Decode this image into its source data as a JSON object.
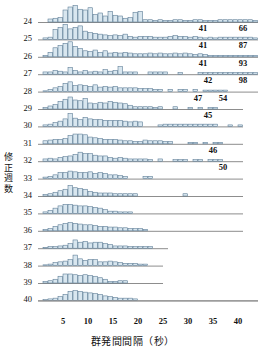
{
  "axes": {
    "y_title": "修正週数",
    "y_title_chars": [
      "修",
      "正",
      "週",
      "数"
    ],
    "x_title": "群発間間隔（秒）",
    "x_ticks": [
      5,
      10,
      15,
      20,
      25,
      30,
      35,
      40
    ],
    "x_min": 0,
    "x_max": 44,
    "row_labels": [
      24,
      25,
      26,
      27,
      28,
      29,
      30,
      31,
      32,
      33,
      34,
      35,
      36,
      37,
      38,
      39,
      40
    ]
  },
  "colors": {
    "bar_fill": "#d8e6ef",
    "bar_stroke": "#53748f",
    "baseline": "#8d8d8d",
    "text": "#111111"
  },
  "chart_data": {
    "type": "bar",
    "title": "",
    "xlabel": "群発間間隔（秒）",
    "ylabel": "修正週数",
    "xlim": [
      0,
      44
    ],
    "grid": false,
    "legend": null,
    "bin_width": 1,
    "note": "Ridgeline of 17 histograms, one per corrected gestational week (24-40). Values are relative frequencies per 1-second bin of inter-burst interval.",
    "series": [
      {
        "name": "24",
        "baseline_end": 44,
        "annotations": [
          {
            "text": "41",
            "x": 33
          },
          {
            "text": "66",
            "x": 41
          }
        ],
        "values": [
          0,
          0,
          4,
          5,
          6,
          16,
          20,
          22,
          17,
          16,
          19,
          10,
          12,
          8,
          14,
          9,
          8,
          5,
          6,
          13,
          14,
          3,
          3,
          2,
          3,
          2,
          2,
          3,
          3,
          2,
          2,
          3,
          3,
          2,
          2,
          2,
          3,
          3,
          3,
          3,
          3,
          3,
          3,
          2
        ]
      },
      {
        "name": "25",
        "baseline_end": 44,
        "annotations": [
          {
            "text": "41",
            "x": 33
          },
          {
            "text": "87",
            "x": 41
          }
        ],
        "values": [
          0,
          2,
          3,
          13,
          16,
          20,
          14,
          16,
          18,
          11,
          9,
          8,
          7,
          6,
          5,
          6,
          5,
          7,
          4,
          3,
          4,
          4,
          4,
          3,
          3,
          3,
          4,
          5,
          4,
          4,
          3,
          4,
          3,
          2,
          3,
          2,
          3,
          3,
          3,
          3,
          3,
          3,
          3,
          2
        ]
      },
      {
        "name": "26",
        "baseline_end": 44,
        "annotations": [
          {
            "text": "41",
            "x": 33
          },
          {
            "text": "93",
            "x": 41
          }
        ],
        "values": [
          0,
          2,
          6,
          12,
          15,
          18,
          20,
          14,
          11,
          8,
          7,
          9,
          6,
          8,
          5,
          6,
          5,
          6,
          5,
          4,
          4,
          4,
          5,
          4,
          5,
          4,
          4,
          5,
          4,
          5,
          4,
          3,
          4,
          3,
          2,
          2,
          2,
          2,
          2,
          2,
          2,
          2,
          2,
          2
        ]
      },
      {
        "name": "27",
        "baseline_end": 44,
        "annotations": [
          {
            "text": "42",
            "x": 34
          },
          {
            "text": "98",
            "x": 41
          }
        ],
        "values": [
          0,
          3,
          3,
          5,
          4,
          3,
          9,
          5,
          3,
          5,
          3,
          4,
          3,
          6,
          4,
          5,
          10,
          3,
          3,
          3,
          0,
          0,
          3,
          3,
          3,
          3,
          0,
          0,
          2,
          0,
          0,
          0,
          2,
          2,
          2,
          2,
          2,
          2,
          2,
          2,
          2,
          2,
          2,
          2
        ]
      },
      {
        "name": "28",
        "baseline_end": 44,
        "annotations": [
          {
            "text": "47",
            "x": 32
          },
          {
            "text": "54",
            "x": 37
          }
        ],
        "values": [
          0,
          1,
          3,
          5,
          7,
          11,
          13,
          8,
          9,
          8,
          7,
          9,
          6,
          7,
          6,
          7,
          5,
          5,
          5,
          5,
          4,
          4,
          4,
          3,
          3,
          0,
          3,
          0,
          3,
          3,
          0,
          3,
          0,
          2,
          2,
          2,
          2,
          2,
          0,
          0,
          0,
          0,
          0,
          0
        ]
      },
      {
        "name": "29",
        "baseline_end": 41,
        "annotations": [
          {
            "text": "45",
            "x": 34
          }
        ],
        "values": [
          0,
          2,
          4,
          6,
          10,
          13,
          16,
          12,
          11,
          14,
          8,
          7,
          9,
          8,
          10,
          9,
          8,
          7,
          5,
          3,
          3,
          3,
          3,
          2,
          3,
          0,
          0,
          3,
          0,
          0,
          2,
          0,
          2,
          0,
          2,
          2,
          0,
          0,
          0,
          0,
          0
        ]
      },
      {
        "name": "30",
        "baseline_end": 41,
        "annotations": [],
        "values": [
          0,
          2,
          3,
          5,
          7,
          10,
          17,
          11,
          9,
          12,
          10,
          9,
          9,
          8,
          8,
          8,
          8,
          7,
          6,
          7,
          6,
          0,
          0,
          0,
          2,
          3,
          3,
          3,
          3,
          3,
          3,
          3,
          3,
          3,
          3,
          3,
          0,
          0,
          2,
          0,
          2
        ]
      },
      {
        "name": "31",
        "baseline_end": 41,
        "annotations": [
          {
            "text": "46",
            "x": 35
          }
        ],
        "values": [
          0,
          4,
          5,
          6,
          6,
          7,
          11,
          13,
          13,
          12,
          9,
          8,
          7,
          6,
          6,
          6,
          5,
          4,
          4,
          3,
          3,
          5,
          4,
          4,
          4,
          3,
          3,
          0,
          0,
          0,
          2,
          2,
          0,
          2,
          0,
          2,
          2,
          0,
          0,
          0,
          0
        ]
      },
      {
        "name": "32",
        "baseline_end": 41,
        "annotations": [
          {
            "text": "50",
            "x": 37
          }
        ],
        "values": [
          0,
          3,
          4,
          3,
          5,
          6,
          7,
          9,
          12,
          10,
          10,
          8,
          7,
          7,
          5,
          4,
          5,
          4,
          3,
          3,
          3,
          3,
          2,
          0,
          3,
          0,
          0,
          2,
          2,
          2,
          0,
          2,
          2,
          0,
          2,
          2,
          2,
          0,
          0,
          0,
          0
        ]
      },
      {
        "name": "33",
        "baseline_end": 41,
        "annotations": [],
        "values": [
          0,
          2,
          3,
          5,
          8,
          8,
          10,
          9,
          8,
          8,
          9,
          7,
          8,
          7,
          5,
          5,
          4,
          3,
          0,
          0,
          0,
          3,
          3,
          0,
          0,
          0,
          0,
          0,
          0,
          0,
          0,
          0,
          0,
          0,
          0,
          0,
          0,
          0,
          0,
          0,
          0
        ]
      },
      {
        "name": "34",
        "baseline_end": 41,
        "annotations": [],
        "values": [
          0,
          2,
          3,
          5,
          7,
          9,
          14,
          11,
          10,
          9,
          6,
          5,
          4,
          4,
          4,
          3,
          3,
          3,
          3,
          3,
          0,
          0,
          0,
          0,
          0,
          0,
          0,
          0,
          0,
          3,
          0,
          0,
          0,
          0,
          0,
          0,
          0,
          0,
          0,
          0,
          0
        ]
      },
      {
        "name": "35",
        "baseline_end": 41,
        "annotations": [],
        "values": [
          0,
          2,
          4,
          7,
          10,
          12,
          12,
          11,
          10,
          10,
          9,
          8,
          7,
          5,
          3,
          3,
          2,
          2,
          2,
          0,
          0,
          0,
          0,
          0,
          0,
          0,
          0,
          0,
          0,
          0,
          0,
          0,
          0,
          0,
          0,
          0,
          0,
          0,
          0,
          0,
          0
        ]
      },
      {
        "name": "36",
        "baseline_end": 41,
        "annotations": [],
        "values": [
          0,
          2,
          3,
          6,
          8,
          10,
          11,
          10,
          9,
          8,
          8,
          7,
          6,
          6,
          5,
          5,
          4,
          4,
          3,
          3,
          3,
          2,
          0,
          0,
          0,
          0,
          0,
          0,
          0,
          0,
          0,
          0,
          0,
          0,
          0,
          0,
          0,
          0,
          0,
          0,
          0
        ]
      },
      {
        "name": "37",
        "baseline_end": 26,
        "annotations": [],
        "values": [
          0,
          1,
          2,
          2,
          3,
          4,
          6,
          11,
          8,
          9,
          7,
          8,
          8,
          6,
          5,
          3,
          3,
          3,
          2,
          2,
          2,
          2,
          2,
          0,
          0,
          0
        ]
      },
      {
        "name": "38",
        "baseline_end": 25,
        "annotations": [],
        "values": [
          0,
          1,
          2,
          4,
          5,
          6,
          8,
          14,
          9,
          7,
          8,
          8,
          5,
          5,
          6,
          5,
          4,
          3,
          3,
          3,
          2,
          2,
          0,
          0,
          0
        ]
      },
      {
        "name": "39",
        "baseline_end": 25,
        "annotations": [],
        "values": [
          0,
          2,
          3,
          5,
          9,
          12,
          12,
          11,
          10,
          11,
          10,
          9,
          7,
          5,
          2,
          2,
          3,
          3,
          0,
          0,
          0,
          0,
          0,
          0,
          0
        ]
      },
      {
        "name": "40",
        "baseline_end": 44,
        "annotations": [],
        "values": [
          0,
          1,
          2,
          3,
          5,
          8,
          12,
          13,
          12,
          11,
          10,
          9,
          8,
          6,
          5,
          4,
          3,
          3,
          3,
          2,
          0,
          0,
          0,
          0,
          0,
          0,
          0,
          0,
          0,
          0,
          0,
          0,
          0,
          0,
          0,
          0,
          0,
          0,
          0,
          0,
          0,
          0,
          0,
          0
        ]
      }
    ]
  }
}
